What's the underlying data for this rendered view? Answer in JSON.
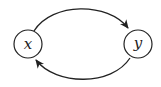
{
  "diagram": {
    "type": "directed-graph",
    "colors": {
      "stroke": "#222222",
      "background": "#ffffff"
    },
    "nodes": [
      {
        "id": "x",
        "label": "x"
      },
      {
        "id": "y",
        "label": "y"
      }
    ],
    "edges": [
      {
        "from": "x",
        "to": "y",
        "shape": "arc-top"
      },
      {
        "from": "y",
        "to": "x",
        "shape": "arc-bottom"
      }
    ]
  }
}
